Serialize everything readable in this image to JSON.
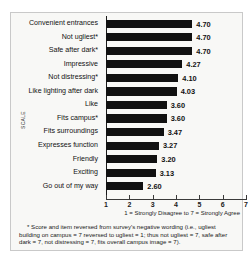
{
  "chart_data": {
    "type": "bar",
    "orientation": "horizontal",
    "title": "",
    "xlabel": "",
    "ylabel": "SCALE",
    "xlim": [
      1,
      7
    ],
    "xticks": [
      "1",
      "2",
      "3",
      "4",
      "5",
      "6",
      "7"
    ],
    "grid": false,
    "legend": null,
    "bar_color": "#111111",
    "categories": [
      "Convenient entrances",
      "Not ugliest*",
      "Safe after dark*",
      "Impressive",
      "Not distressing*",
      "Like lighting after dark",
      "Like",
      "Fits campus*",
      "Fits surroundings",
      "Expresses function",
      "Friendly",
      "Exciting",
      "Go out of my way"
    ],
    "values": [
      4.7,
      4.7,
      4.7,
      4.27,
      4.1,
      4.03,
      3.6,
      3.6,
      3.47,
      3.27,
      3.2,
      3.13,
      2.6
    ],
    "value_labels": [
      "4.70",
      "4.70",
      "4.70",
      "4.27",
      "4.10",
      "4.03",
      "3.60",
      "3.60",
      "3.47",
      "3.27",
      "3.20",
      "3.13",
      "2.60"
    ]
  },
  "axis": {
    "y_title": "SCALE",
    "x_caption": "1 = Strongly Disagree to 7 = Strongly Agree"
  },
  "footnote": "* Score and item reversed from survey's negative wording (i.e., ugliest building on campus = 7 reversed to ugliest = 1; thus not ugliest = 7, safe after dark = 7, not distressing = 7, fits overall campus image = 7)."
}
